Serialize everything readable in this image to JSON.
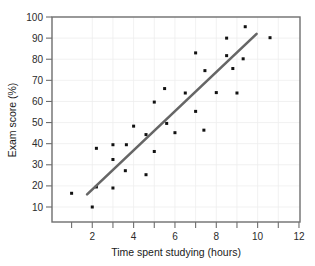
{
  "chart_data": {
    "type": "scatter",
    "title": "",
    "xlabel": "Time spent studying (hours)",
    "ylabel": "Exam score (%)",
    "xlim": [
      0.9,
      12.0
    ],
    "ylim": [
      4.5,
      101.5
    ],
    "xticks": [
      2,
      4,
      6,
      8,
      10,
      12
    ],
    "xticks_minor": [
      1,
      3,
      5,
      7,
      9,
      11
    ],
    "yticks": [
      10,
      20,
      30,
      40,
      50,
      60,
      70,
      80,
      90,
      100
    ],
    "grid": true,
    "legend": "none",
    "point_color": "#111111",
    "trendline_color": "#666666",
    "points": [
      {
        "x": 1.0,
        "y": 16.5
      },
      {
        "x": 2.0,
        "y": 10.0
      },
      {
        "x": 2.2,
        "y": 19.5
      },
      {
        "x": 2.2,
        "y": 37.8
      },
      {
        "x": 3.0,
        "y": 19.0
      },
      {
        "x": 3.0,
        "y": 32.5
      },
      {
        "x": 3.0,
        "y": 39.5
      },
      {
        "x": 3.6,
        "y": 27.2
      },
      {
        "x": 3.65,
        "y": 39.5
      },
      {
        "x": 4.0,
        "y": 48.3
      },
      {
        "x": 4.6,
        "y": 25.3
      },
      {
        "x": 4.6,
        "y": 44.3
      },
      {
        "x": 5.0,
        "y": 36.3
      },
      {
        "x": 5.0,
        "y": 59.7
      },
      {
        "x": 5.5,
        "y": 66.1
      },
      {
        "x": 5.6,
        "y": 49.6
      },
      {
        "x": 6.0,
        "y": 45.2
      },
      {
        "x": 6.5,
        "y": 64.0
      },
      {
        "x": 7.0,
        "y": 55.3
      },
      {
        "x": 7.0,
        "y": 83.0
      },
      {
        "x": 7.4,
        "y": 46.4
      },
      {
        "x": 7.45,
        "y": 74.6
      },
      {
        "x": 8.0,
        "y": 64.2
      },
      {
        "x": 8.5,
        "y": 81.7
      },
      {
        "x": 8.5,
        "y": 90.0
      },
      {
        "x": 8.8,
        "y": 75.6
      },
      {
        "x": 9.0,
        "y": 64.0
      },
      {
        "x": 9.3,
        "y": 80.2
      },
      {
        "x": 9.4,
        "y": 95.4
      },
      {
        "x": 10.6,
        "y": 90.2
      }
    ],
    "trendline": {
      "x1": 1.75,
      "y1": 16.0,
      "x2": 9.95,
      "y2": 92.0
    }
  },
  "a11y": {
    "chart_role": "scatter-plot-with-trendline"
  }
}
